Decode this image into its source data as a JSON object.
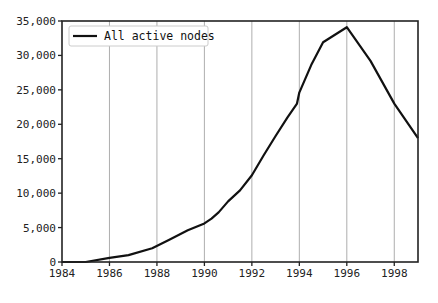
{
  "chart_data": {
    "type": "line",
    "title": "",
    "xlabel": "",
    "ylabel": "",
    "xlim": [
      1984,
      1999
    ],
    "ylim": [
      0,
      35000
    ],
    "grid": {
      "x": true,
      "y": false
    },
    "legend_position": "upper left",
    "x_ticks": [
      1984,
      1986,
      1988,
      1990,
      1992,
      1994,
      1996,
      1998
    ],
    "x_tick_labels": [
      "1984",
      "1986",
      "1988",
      "1990",
      "1992",
      "1994",
      "1996",
      "1998"
    ],
    "y_ticks": [
      0,
      5000,
      10000,
      15000,
      20000,
      25000,
      30000,
      35000
    ],
    "y_tick_labels": [
      "0",
      "5,000",
      "10,000",
      "15,000",
      "20,000",
      "25,000",
      "30,000",
      "35,000"
    ],
    "series": [
      {
        "name": "All active nodes",
        "color": "#111111",
        "x": [
          1984,
          1985,
          1986,
          1986.8,
          1987.8,
          1988.5,
          1989.3,
          1990,
          1990.3,
          1990.6,
          1991,
          1991.5,
          1992,
          1992.5,
          1993,
          1993.5,
          1993.9,
          1994,
          1994.5,
          1995,
          1996,
          1997,
          1998,
          1999
        ],
        "values": [
          0,
          0,
          600,
          1000,
          2000,
          3200,
          4600,
          5600,
          6300,
          7200,
          8800,
          10400,
          12600,
          15500,
          18300,
          21000,
          23000,
          24600,
          28600,
          31900,
          34100,
          29200,
          23000,
          18000
        ]
      }
    ]
  },
  "legend": {
    "items": [
      {
        "label": "All active nodes",
        "color": "#111111"
      }
    ]
  }
}
